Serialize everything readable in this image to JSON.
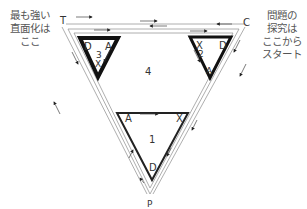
{
  "notes": {
    "left": "最も強い\n直面化は\nここ",
    "right": "問題の\n探究は\nここから\nスタート"
  },
  "vertices": {
    "top_left": "T",
    "top_right": "C",
    "bottom": "P"
  },
  "regions": {
    "center": "4"
  },
  "triangles": [
    {
      "id": "1",
      "number": "1",
      "labels": {
        "top_left": "A",
        "top_right": "X",
        "bottom": "D"
      }
    },
    {
      "id": "2",
      "number": "2",
      "labels": {
        "top_left": "X",
        "top_right": "D",
        "bottom": "A"
      }
    },
    {
      "id": "3",
      "number": "3",
      "labels": {
        "top_left": "D",
        "top_right": "A",
        "bottom": "X"
      }
    }
  ],
  "colors": {
    "thick_line": "#111111",
    "thin_line": "#888888",
    "text": "#333333"
  }
}
